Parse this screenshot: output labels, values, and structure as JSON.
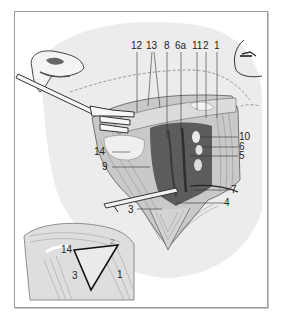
{
  "figure": {
    "colors": {
      "background": "#ffffff",
      "frame_border": "#9a9a9a",
      "skin_shading": "#e9e9e9",
      "tissue_mid": "#bdbdbd",
      "tissue_dark": "#5a5a5a",
      "line": "#333333",
      "triangle_outline": "#111111"
    },
    "main_labels": [
      {
        "id": "12",
        "text": "12"
      },
      {
        "id": "13",
        "text": "13"
      },
      {
        "id": "8",
        "text": "8"
      },
      {
        "id": "6a",
        "text": "6a"
      },
      {
        "id": "11",
        "text": "11"
      },
      {
        "id": "2",
        "text": "2"
      },
      {
        "id": "1",
        "text": "1"
      },
      {
        "id": "10",
        "text": "10"
      },
      {
        "id": "6",
        "text": "6"
      },
      {
        "id": "5",
        "text": "5"
      },
      {
        "id": "14",
        "text": "14"
      },
      {
        "id": "9",
        "text": "9"
      },
      {
        "id": "7",
        "text": "7"
      },
      {
        "id": "4",
        "text": "4"
      },
      {
        "id": "3",
        "text": "3"
      }
    ],
    "inset_labels": [
      {
        "id": "14",
        "text": "14"
      },
      {
        "id": "2",
        "text": "2"
      },
      {
        "id": "3",
        "text": "3"
      },
      {
        "id": "1",
        "text": "1"
      }
    ]
  }
}
